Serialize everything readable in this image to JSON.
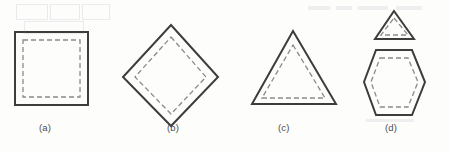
{
  "figure": {
    "type": "geometric-outline-diagram",
    "background_color": "#fdfdfc",
    "solid_stroke_color": "#3d3d3d",
    "dashed_stroke_color": "#8a8a8a",
    "solid_stroke_width": 2,
    "dashed_stroke_width": 1.3,
    "dash_pattern": "5 3",
    "panels": [
      {
        "key": "a",
        "label": "(a)",
        "label_x": 48,
        "label_y": 132,
        "shapes": [
          {
            "name": "outer-square",
            "style": "solid",
            "points": "15,32 88,32 88,105 15,105"
          },
          {
            "name": "inner-square-dashed",
            "style": "dashed",
            "points": "23,40 80,40 80,97 23,97"
          }
        ]
      },
      {
        "key": "b",
        "label": "(b)",
        "label_x": 176,
        "label_y": 132,
        "shapes": [
          {
            "name": "outer-diamond",
            "style": "solid",
            "points": "171,25 218,77 171,126 123,77"
          },
          {
            "name": "inner-diamond-dashed",
            "style": "dashed",
            "points": "171,37 206,77 171,114 135,77"
          }
        ]
      },
      {
        "key": "c",
        "label": "(c)",
        "label_x": 287,
        "label_y": 132,
        "shapes": [
          {
            "name": "outer-triangle",
            "style": "solid",
            "points": "293,31 336,104 252,104"
          },
          {
            "name": "inner-triangle-dashed",
            "style": "dashed",
            "points": "293,45 325,98 262,98"
          }
        ]
      },
      {
        "key": "d",
        "label": "(d)",
        "label_x": 394,
        "label_y": 132,
        "shapes": [
          {
            "name": "outer-triangle-small",
            "style": "solid",
            "points": "394,11 414,39 375,39"
          },
          {
            "name": "inner-triangle-small-dashed",
            "style": "dashed",
            "points": "394,18 408,35 381,35"
          },
          {
            "name": "outer-hexagon",
            "style": "solid",
            "points": "376,50 412,50 425,82 412,115 376,115 364,82"
          },
          {
            "name": "inner-hexagon-dashed",
            "style": "dashed",
            "points": "380,58 408,58 418,82 408,107 380,107 371,82"
          }
        ]
      }
    ],
    "scan_artifacts": [
      {
        "name": "bleed-box-1",
        "x": 16,
        "y": 4,
        "width": 30,
        "height": 14
      },
      {
        "name": "bleed-box-2",
        "x": 50,
        "y": 4,
        "width": 28,
        "height": 14
      },
      {
        "name": "bleed-box-3",
        "x": 82,
        "y": 4,
        "width": 26,
        "height": 14
      },
      {
        "name": "bleed-box-4",
        "x": 24,
        "y": 21,
        "width": 58,
        "height": 11
      },
      {
        "name": "bleed-bar-1",
        "x": 308,
        "y": 6,
        "width": 22,
        "height": 4
      },
      {
        "name": "bleed-bar-2",
        "x": 336,
        "y": 6,
        "width": 16,
        "height": 4
      },
      {
        "name": "bleed-bar-3",
        "x": 358,
        "y": 6,
        "width": 30,
        "height": 4
      },
      {
        "name": "bleed-bar-4",
        "x": 396,
        "y": 6,
        "width": 26,
        "height": 4
      },
      {
        "name": "bleed-bar-5",
        "x": 366,
        "y": 119,
        "width": 48,
        "height": 3
      }
    ]
  }
}
